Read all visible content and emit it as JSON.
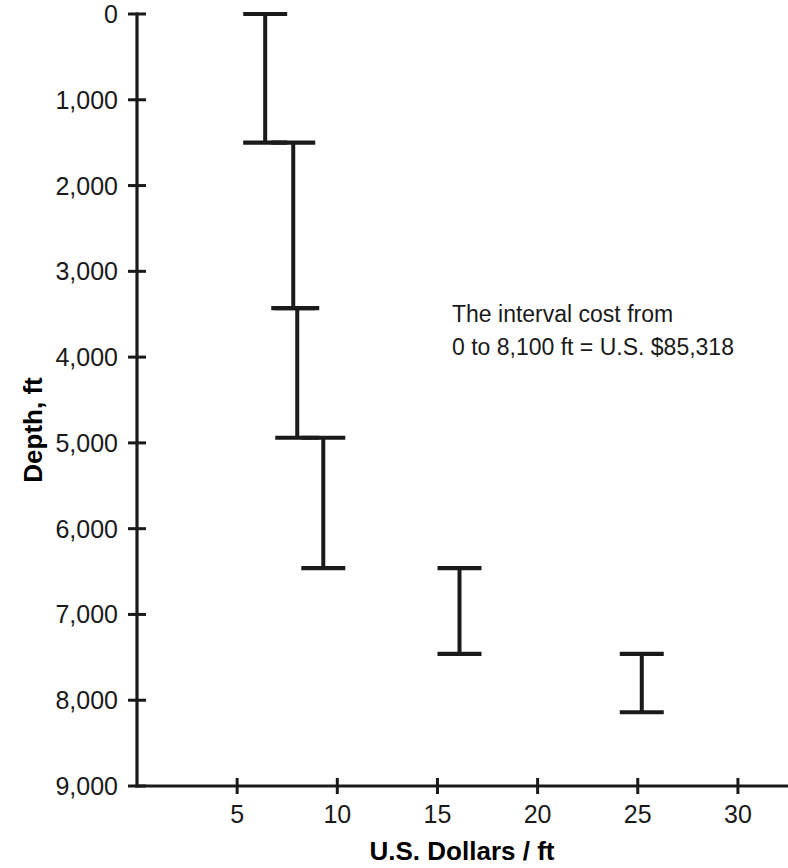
{
  "chart_data": {
    "type": "bar",
    "title": "",
    "subtitle": "",
    "xlabel": "U.S. Dollars / ft",
    "ylabel": "Depth, ft",
    "xlim": [
      0,
      32.5
    ],
    "ylim": [
      0,
      9000
    ],
    "y_inverted": true,
    "grid": false,
    "legend": null,
    "xticks": [
      5,
      10,
      15,
      20,
      25,
      30
    ],
    "xtick_labels": [
      "5",
      "10",
      "15",
      "20",
      "25",
      "30"
    ],
    "yticks": [
      0,
      1000,
      2000,
      3000,
      4000,
      5000,
      6000,
      7000,
      8000,
      9000
    ],
    "ytick_labels": [
      "0",
      "1,000",
      "2,000",
      "3,000",
      "4,000",
      "5,000",
      "6,000",
      "7,000",
      "8,000",
      "9,000"
    ],
    "series": [
      {
        "name": "Drilling cost per foot by depth interval",
        "style": "horizontal-capped-vertical-segments",
        "points": [
          {
            "cost": 6.4,
            "depth_top": 0,
            "depth_bottom": 1500
          },
          {
            "cost": 7.8,
            "depth_top": 1500,
            "depth_bottom": 3430
          },
          {
            "cost": 8.0,
            "depth_top": 3430,
            "depth_bottom": 4940
          },
          {
            "cost": 9.3,
            "depth_top": 4940,
            "depth_bottom": 6460
          },
          {
            "cost": 16.1,
            "depth_top": 6460,
            "depth_bottom": 7460
          },
          {
            "cost": 25.2,
            "depth_top": 7460,
            "depth_bottom": 8140
          }
        ]
      }
    ],
    "annotations": [
      {
        "id": "interval-cost-note",
        "line1": "The interval cost from",
        "line2": "0 to 8,100 ft = U.S. $85,318",
        "x": 16.8,
        "y": 3450
      }
    ],
    "colors": {
      "axis": "#1a1a1a",
      "data": "#1a1a1a",
      "background": "#ffffff",
      "text": "#1a1a1a"
    }
  }
}
